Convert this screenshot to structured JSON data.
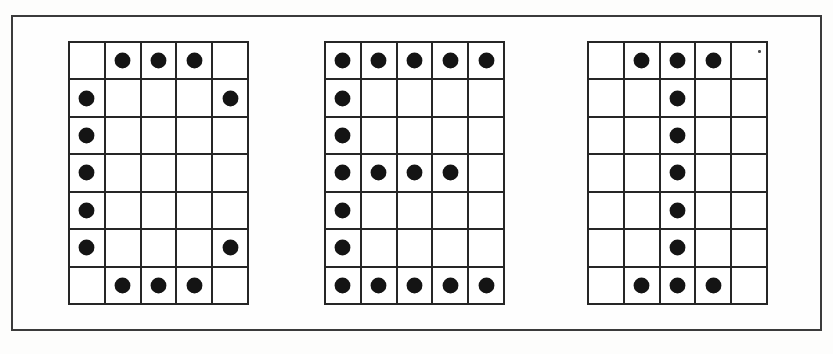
{
  "figure": {
    "frame_color": "#3b3b3b",
    "grid_line_color": "#262626",
    "dot_color": "#141414",
    "background_color": "#fefefe",
    "grid_columns": 5,
    "grid_rows": 7
  },
  "grids": [
    {
      "name": "grid-c",
      "letter": "C",
      "columns": 5,
      "rows": 7,
      "matrix": [
        [
          0,
          1,
          1,
          1,
          0
        ],
        [
          1,
          0,
          0,
          0,
          1
        ],
        [
          1,
          0,
          0,
          0,
          0
        ],
        [
          1,
          0,
          0,
          0,
          0
        ],
        [
          1,
          0,
          0,
          0,
          0
        ],
        [
          1,
          0,
          0,
          0,
          1
        ],
        [
          0,
          1,
          1,
          1,
          0
        ]
      ],
      "dot_count": 12
    },
    {
      "name": "grid-e",
      "letter": "E",
      "columns": 5,
      "rows": 7,
      "matrix": [
        [
          1,
          1,
          1,
          1,
          1
        ],
        [
          1,
          0,
          0,
          0,
          0
        ],
        [
          1,
          0,
          0,
          0,
          0
        ],
        [
          1,
          1,
          1,
          1,
          0
        ],
        [
          1,
          0,
          0,
          0,
          0
        ],
        [
          1,
          0,
          0,
          0,
          0
        ],
        [
          1,
          1,
          1,
          1,
          1
        ]
      ],
      "dot_count": 18
    },
    {
      "name": "grid-i",
      "letter": "I",
      "columns": 5,
      "rows": 7,
      "matrix": [
        [
          0,
          1,
          1,
          1,
          0
        ],
        [
          0,
          0,
          1,
          0,
          0
        ],
        [
          0,
          0,
          1,
          0,
          0
        ],
        [
          0,
          0,
          1,
          0,
          0
        ],
        [
          0,
          0,
          1,
          0,
          0
        ],
        [
          0,
          0,
          1,
          0,
          0
        ],
        [
          0,
          1,
          1,
          1,
          0
        ]
      ],
      "dot_count": 11,
      "artifact": {
        "row": 0,
        "col": 4,
        "kind": "scan-speck"
      }
    }
  ]
}
